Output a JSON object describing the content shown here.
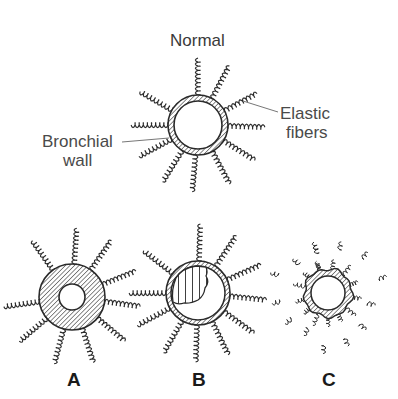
{
  "diagram": {
    "title": "Normal",
    "callouts": {
      "bronchial_wall": [
        "Bronchial",
        "wall"
      ],
      "elastic_fibers": [
        "Elastic",
        "fibers"
      ]
    },
    "panels": [
      {
        "id": "normal",
        "label": "Normal",
        "cx": 198,
        "cy": 125,
        "outer_r": 30,
        "inner_r": 24,
        "fill": "hatched-ring",
        "fibers": 11
      },
      {
        "id": "A",
        "label": "A",
        "cx": 72,
        "cy": 297,
        "outer_r": 33,
        "inner_r": 13,
        "fill": "thick-hatched-wall",
        "fibers": 10
      },
      {
        "id": "B",
        "label": "B",
        "cx": 198,
        "cy": 293,
        "outer_r": 32,
        "inner_r": 27,
        "fill": "ring-with-mucus-plug",
        "fibers": 11
      },
      {
        "id": "C",
        "label": "C",
        "cx": 328,
        "cy": 293,
        "outer_r": 24,
        "inner_r": 17,
        "fill": "ragged-wall-broken-fibers",
        "fibers": 14
      }
    ],
    "colors": {
      "ink": "#2a2a2a",
      "leader": "#777777",
      "background": "#ffffff"
    }
  }
}
